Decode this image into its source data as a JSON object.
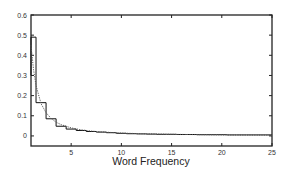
{
  "chart_data": {
    "type": "line",
    "title": "",
    "xlabel": "Word Frequency",
    "ylabel": "",
    "xlim": [
      1,
      25
    ],
    "ylim": [
      -0.05,
      0.6
    ],
    "grid": false,
    "legend": null,
    "x_ticks": [
      5,
      10,
      15,
      20,
      25
    ],
    "x_tick_labels": [
      "5",
      "10",
      "15",
      "20",
      "25"
    ],
    "y_ticks": [
      0,
      0.1,
      0.2,
      0.3,
      0.4,
      0.5,
      0.6
    ],
    "y_tick_labels": [
      "0",
      "0.1",
      "0.2",
      "0.3",
      "0.4",
      "0.5",
      "0.6"
    ],
    "series": [
      {
        "name": "empirical (histogram steps)",
        "style": "solid-step",
        "x": [
          1,
          2,
          3,
          4,
          5,
          6,
          7,
          8,
          9,
          10,
          11,
          12,
          13,
          14,
          15,
          16,
          17,
          18,
          19,
          20,
          21,
          22,
          23,
          24,
          25
        ],
        "values": [
          0.49,
          0.165,
          0.085,
          0.048,
          0.034,
          0.027,
          0.022,
          0.019,
          0.016,
          0.013,
          0.011,
          0.01,
          0.009,
          0.008,
          0.008,
          0.007,
          0.007,
          0.006,
          0.006,
          0.006,
          0.005,
          0.005,
          0.005,
          0.005,
          0.005
        ]
      },
      {
        "name": "fitted power-law",
        "style": "dotted",
        "x": [
          1,
          1.25,
          1.5,
          2,
          2.5,
          3,
          3.5,
          4,
          5,
          6,
          7,
          8,
          10,
          12,
          15,
          20,
          25
        ],
        "values": [
          0.45,
          0.33,
          0.25,
          0.16,
          0.115,
          0.087,
          0.068,
          0.056,
          0.04,
          0.03,
          0.024,
          0.02,
          0.014,
          0.011,
          0.008,
          0.005,
          0.004
        ]
      }
    ]
  }
}
